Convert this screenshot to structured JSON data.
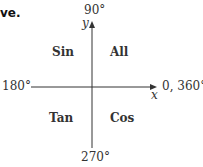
{
  "header": {
    "fragment": "ve."
  },
  "diagram": {
    "type": "CAST quadrant diagram",
    "axes": {
      "y_label": "y",
      "x_label": "x",
      "top": "90°",
      "bottom": "270°",
      "left": "180°",
      "right": "0, 360°"
    },
    "quadrants": {
      "top_left": "Sin",
      "top_right": "All",
      "bottom_left": "Tan",
      "bottom_right": "Cos"
    },
    "colors": {
      "line": "#333333",
      "text": "#333333"
    }
  }
}
